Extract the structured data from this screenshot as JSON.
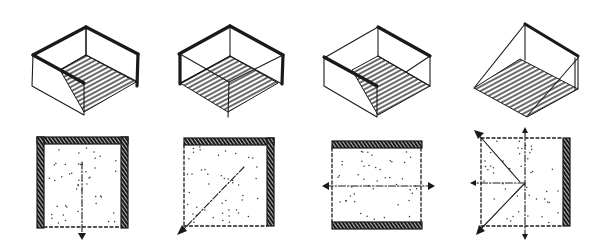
{
  "ink_color": "#1a1a1a",
  "background_color": "#ffffff",
  "figures": [
    {
      "id": "enclosure-1",
      "axonometric": {
        "walls": [
          "back-left",
          "back-right",
          "front-left"
        ],
        "open_sides": [
          "front-right"
        ],
        "floor": "hatched"
      },
      "plan": {
        "solid_walls": [
          "top",
          "left",
          "right"
        ],
        "open_edges": [
          "bottom"
        ],
        "movement": [
          "down"
        ]
      }
    },
    {
      "id": "enclosure-2",
      "axonometric": {
        "walls": [
          "back-left",
          "back-right"
        ],
        "open_sides": [
          "front-left",
          "front-right"
        ],
        "floor": "hatched"
      },
      "plan": {
        "solid_walls": [
          "top",
          "right"
        ],
        "open_edges": [
          "left",
          "bottom"
        ],
        "movement": [
          "down-left"
        ]
      }
    },
    {
      "id": "enclosure-3",
      "axonometric": {
        "walls": [
          "back-right",
          "front-left"
        ],
        "open_sides": [
          "back-left",
          "front-right"
        ],
        "floor": "hatched"
      },
      "plan": {
        "solid_walls": [
          "top",
          "bottom"
        ],
        "open_edges": [
          "left",
          "right"
        ],
        "movement": [
          "left",
          "right"
        ]
      }
    },
    {
      "id": "enclosure-4",
      "axonometric": {
        "walls": [
          "back-right"
        ],
        "open_sides": [
          "back-left",
          "front-left",
          "front-right"
        ],
        "floor": "hatched"
      },
      "plan": {
        "solid_walls": [
          "right"
        ],
        "open_edges": [
          "top",
          "left",
          "bottom"
        ],
        "movement": [
          "up",
          "up-left",
          "left",
          "down-left",
          "down"
        ]
      }
    }
  ]
}
